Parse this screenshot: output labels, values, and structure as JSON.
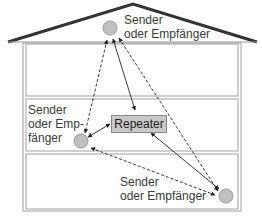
{
  "diagram": {
    "nodes": {
      "top": {
        "label_line1": "Sender",
        "label_line2": "oder Empfänger"
      },
      "left": {
        "label_line1": "Sender",
        "label_line2": "oder Emp-",
        "label_line3": "fänger"
      },
      "bottom_right": {
        "label_line1": "Sender",
        "label_line2": "oder Empfänger"
      },
      "repeater": {
        "label": "Repeater"
      }
    },
    "colors": {
      "roof": "#333333",
      "walls": "#a0a0a0",
      "node_fill": "#c0c0c0",
      "repeater_fill": "#c8c8c8",
      "arrow": "#222222"
    }
  }
}
